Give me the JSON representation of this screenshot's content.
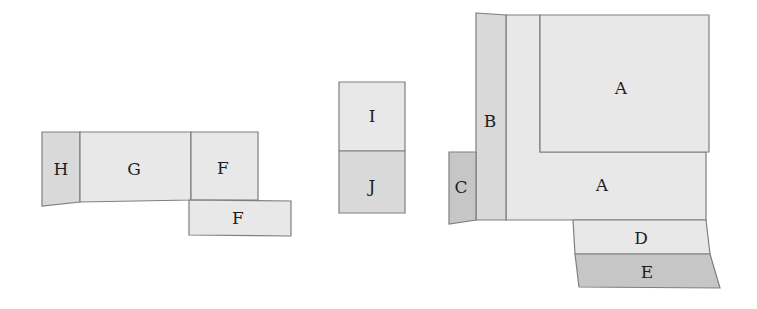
{
  "diagram": {
    "type": "dissection-pieces",
    "groups": [
      {
        "name": "left-group",
        "pieces": [
          {
            "id": "H",
            "label": "H"
          },
          {
            "id": "G",
            "label": "G"
          },
          {
            "id": "F1",
            "label": "F"
          },
          {
            "id": "F2",
            "label": "F"
          }
        ]
      },
      {
        "name": "middle-group",
        "pieces": [
          {
            "id": "I",
            "label": "I"
          },
          {
            "id": "J",
            "label": "J"
          }
        ]
      },
      {
        "name": "right-group",
        "pieces": [
          {
            "id": "B",
            "label": "B"
          },
          {
            "id": "A1",
            "label": "A"
          },
          {
            "id": "A2",
            "label": "A"
          },
          {
            "id": "C",
            "label": "C"
          },
          {
            "id": "D",
            "label": "D"
          },
          {
            "id": "E",
            "label": "E"
          }
        ]
      }
    ],
    "colors": {
      "fill_light": "#e8e8e8",
      "fill_mid": "#d9d9d9",
      "fill_dark": "#c6c6c6",
      "stroke": "#7f7f7f",
      "text": "#1e1e1e"
    }
  }
}
